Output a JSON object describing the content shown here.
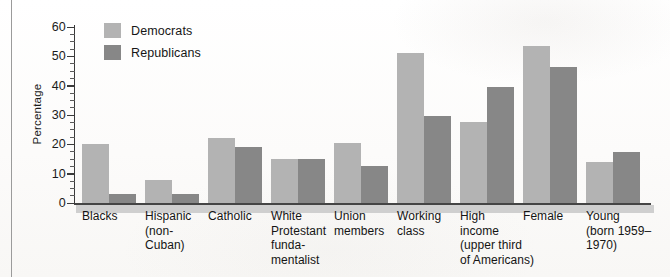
{
  "chart_data": {
    "type": "bar",
    "title": "",
    "xlabel": "",
    "ylabel": "Percentage",
    "ylim": [
      0,
      60
    ],
    "yticks": [
      0,
      10,
      20,
      30,
      40,
      50,
      60
    ],
    "ytick_labels": [
      "0",
      "10",
      "20",
      "30",
      "40",
      "50",
      "60"
    ],
    "minor_tick_step": 2.5,
    "grid": false,
    "legend_position": "top-left",
    "categories": [
      "Blacks",
      "Hispanic\n(non-\nCuban)",
      "Catholic",
      "White\nProtestant\nfunda-\nmentalist",
      "Union\nmembers",
      "Working\nclass",
      "High\nincome\n(upper third\nof Americans)",
      "Female",
      "Young\n(born 1959–\n1970)"
    ],
    "series": [
      {
        "name": "Democrats",
        "color": "#b3b3b3",
        "values": [
          20,
          8,
          22,
          15,
          20.5,
          51,
          27.5,
          53.5,
          14
        ]
      },
      {
        "name": "Republicans",
        "color": "#878787",
        "values": [
          3,
          3,
          19,
          15,
          12.5,
          29.5,
          39.5,
          46.5,
          17.5
        ]
      }
    ]
  },
  "legend": {
    "items": [
      {
        "label": "Democrats",
        "color": "#b3b3b3"
      },
      {
        "label": "Republicans",
        "color": "#878787"
      }
    ]
  },
  "axes": {
    "y_title": "Percentage",
    "y_tick_labels": [
      "60",
      "50",
      "40",
      "30",
      "20",
      "10",
      "0"
    ]
  },
  "annotations": {
    "handwriting_bleed": ""
  }
}
